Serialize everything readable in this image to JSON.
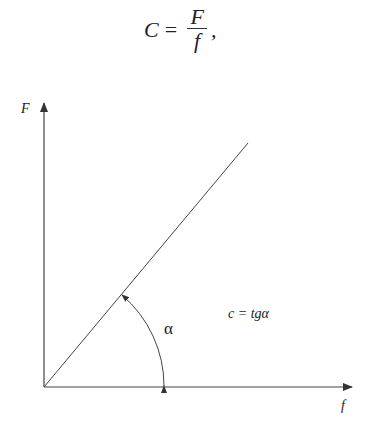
{
  "formula": {
    "lhs": "C",
    "equals": "=",
    "numerator": "F",
    "denominator": "f",
    "trailing": ","
  },
  "diagram": {
    "y_axis_label": "F",
    "x_axis_label": "f",
    "angle_label": "α",
    "relation": "c = tgα",
    "line_color": "#333333"
  }
}
